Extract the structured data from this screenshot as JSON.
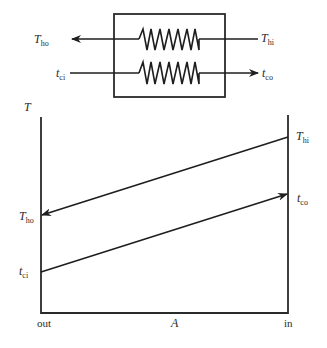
{
  "exchanger": {
    "hot_inlet": {
      "main": "T",
      "sub": "hi"
    },
    "hot_outlet": {
      "main": "T",
      "sub": "ho"
    },
    "cold_inlet": {
      "main": "t",
      "sub": "ci"
    },
    "cold_outlet": {
      "main": "t",
      "sub": "co"
    }
  },
  "graph": {
    "y_axis_label": "T",
    "x_axis_label": "A",
    "x_left_label": "out",
    "x_right_label": "in",
    "T_hi": {
      "main": "T",
      "sub": "hi"
    },
    "T_ho": {
      "main": "T",
      "sub": "ho"
    },
    "t_co": {
      "main": "t",
      "sub": "co"
    },
    "t_ci": {
      "main": "t",
      "sub": "ci"
    }
  },
  "colors": {
    "line": "#1e1e1e",
    "background": "#ffffff"
  }
}
